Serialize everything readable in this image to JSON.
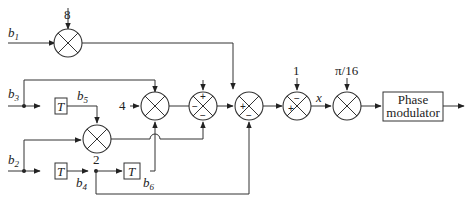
{
  "diagram": {
    "inputs": {
      "b1": {
        "base": "b",
        "sub": "1"
      },
      "b3": {
        "base": "b",
        "sub": "3"
      },
      "b2": {
        "base": "b",
        "sub": "2"
      }
    },
    "intermediate": {
      "b5": {
        "base": "b",
        "sub": "5"
      },
      "b4": {
        "base": "b",
        "sub": "4"
      },
      "b6": {
        "base": "b",
        "sub": "6"
      }
    },
    "delays": {
      "T1": "T",
      "T2": "T",
      "T3": "T"
    },
    "constants": {
      "gain_b1": "8",
      "gain_b3": "4",
      "gain_b5b2": "2",
      "offset": "1",
      "phase_scale": "π/16"
    },
    "signs": {
      "sum1_top": "+",
      "sum1_left": "−",
      "sum1_bottom": "−",
      "sum2_left": "+",
      "sum2_bottom": "−",
      "sum3_top": "−",
      "sum3_left": "+"
    },
    "signal_x": "x",
    "output_block": {
      "line1": "Phase",
      "line2": "modulator"
    }
  }
}
